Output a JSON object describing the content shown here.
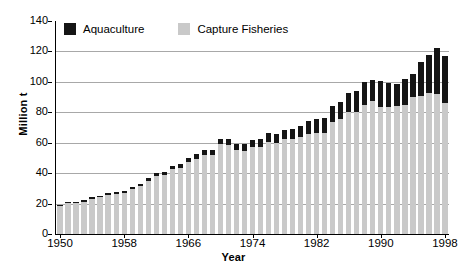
{
  "chart_data": {
    "type": "bar",
    "stacked": true,
    "title": "",
    "xlabel": "Year",
    "ylabel": "Million t",
    "ylim": [
      0,
      140
    ],
    "ytick_values": [
      0,
      20,
      40,
      60,
      80,
      100,
      120,
      140
    ],
    "ytick_labels": [
      "0",
      "20",
      "40",
      "60",
      "80",
      "100",
      "120",
      "140"
    ],
    "xlim": [
      1950,
      1998
    ],
    "xtick_labels": [
      "1950",
      "1958",
      "1966",
      "1974",
      "1982",
      "1990",
      "1998"
    ],
    "xtick_values": [
      1950,
      1958,
      1966,
      1974,
      1982,
      1990,
      1998
    ],
    "grid": "horizontal",
    "legend_position": "top-left",
    "colors": {
      "aquaculture": "#151515",
      "capture_fisheries": "#c9c9c9",
      "gridline": "#a8a8a8",
      "axis": "#000000",
      "background": "#ffffff"
    },
    "categories": [
      1950,
      1951,
      1952,
      1953,
      1954,
      1955,
      1956,
      1957,
      1958,
      1959,
      1960,
      1961,
      1962,
      1963,
      1964,
      1965,
      1966,
      1967,
      1968,
      1969,
      1970,
      1971,
      1972,
      1973,
      1974,
      1975,
      1976,
      1977,
      1978,
      1979,
      1980,
      1981,
      1982,
      1983,
      1984,
      1985,
      1986,
      1987,
      1988,
      1989,
      1990,
      1991,
      1992,
      1993,
      1994,
      1995,
      1996,
      1997,
      1998
    ],
    "series": [
      {
        "name": "Capture Fisheries",
        "color": "#c9c9c9",
        "values": [
          18.7,
          20.4,
          20.4,
          21.2,
          23.1,
          24.2,
          25.8,
          26.4,
          27.2,
          29.3,
          31.3,
          35.0,
          38.0,
          38.6,
          42.5,
          43.2,
          47.4,
          49.5,
          52.0,
          51.8,
          58.9,
          58.6,
          54.9,
          54.8,
          57.3,
          57.3,
          60.8,
          60.0,
          62.2,
          62.5,
          64.0,
          66.0,
          66.5,
          66.5,
          73.6,
          75.4,
          80.4,
          80.3,
          85.0,
          87.5,
          83.8,
          83.5,
          84.3,
          85.1,
          89.9,
          90.9,
          92.4,
          92.0,
          85.8
        ]
      },
      {
        "name": "Aquaculture",
        "color": "#151515",
        "values": [
          0.6,
          0.7,
          0.8,
          0.9,
          1.0,
          1.1,
          1.2,
          1.3,
          1.4,
          1.6,
          1.7,
          1.8,
          2.0,
          2.2,
          2.3,
          2.5,
          2.7,
          2.9,
          3.1,
          3.3,
          3.5,
          3.7,
          4.0,
          4.3,
          4.6,
          4.9,
          5.3,
          5.7,
          6.1,
          6.6,
          7.3,
          8.1,
          9.0,
          9.8,
          10.5,
          11.3,
          12.4,
          13.6,
          15.0,
          13.8,
          16.8,
          16.0,
          14.4,
          16.6,
          15.1,
          22.1,
          25.1,
          30.0,
          31.5
        ]
      }
    ],
    "totals": [
      19.3,
      21.1,
      21.2,
      22.1,
      24.1,
      25.3,
      27.0,
      27.7,
      28.6,
      30.9,
      33.0,
      36.8,
      40.0,
      40.8,
      44.8,
      45.7,
      50.1,
      52.4,
      55.1,
      55.1,
      62.4,
      62.3,
      58.9,
      59.1,
      61.9,
      62.2,
      66.1,
      65.7,
      68.3,
      69.1,
      71.3,
      74.1,
      75.5,
      76.3,
      84.1,
      86.7,
      92.8,
      93.9,
      100.0,
      101.3,
      100.6,
      99.5,
      98.7,
      101.7,
      105.0,
      113.0,
      117.5,
      122.0,
      117.3
    ]
  },
  "legend": {
    "items": [
      {
        "label": "Aquaculture",
        "swatch": "aqua"
      },
      {
        "label": "Capture Fisheries",
        "swatch": "capture"
      }
    ]
  }
}
